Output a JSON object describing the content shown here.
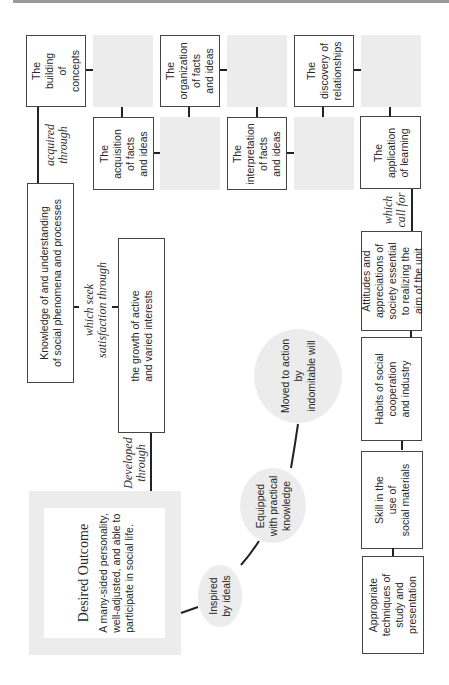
{
  "diagram": {
    "outcome": {
      "title": "Desired Outcome",
      "description": "A many-sided personality,\nwell-adjusted, and able to\nparticipate in social life."
    },
    "connectors": {
      "developed_through": "Developed\nthrough",
      "which_seek": "which seek\nsatisfaction through",
      "acquired_through": "acquired\nthrough",
      "which_call_for": "which\ncall for"
    },
    "circles": [
      {
        "label": "Inspired\nby ideals"
      },
      {
        "label": "Equipped\nwith practical\nknowledge"
      },
      {
        "label": "Moved to action\nby\nindomitable will"
      }
    ],
    "knowledge_box": {
      "label": "Knowledge of and understanding\nof social phenomena and processes"
    },
    "growth_box": {
      "label": "the growth of active\nand varied interests"
    },
    "learning_boxes": [
      {
        "label": "The\nbuilding of\nconcepts"
      },
      {
        "label": "The\nacquisition\nof facts\nand ideas"
      },
      {
        "label": "The\norganization\nof facts\nand ideas"
      },
      {
        "label": "The\ninterpretation\nof facts\nand ideas"
      },
      {
        "label": "The\ndiscovery of\nrelationships"
      },
      {
        "label": "The\napplication\nof learning"
      }
    ],
    "requirement_boxes": [
      {
        "label": "Attitudes and\nappreciations of\nsociety essential\nto realizing the\naim of the unit"
      },
      {
        "label": "Habits of social\ncooperation\nand industry"
      },
      {
        "label": "Skill in the\nuse of\nsocial materials"
      },
      {
        "label": "Appropriate\ntechniques of\nstudy and\npresentation"
      }
    ]
  }
}
